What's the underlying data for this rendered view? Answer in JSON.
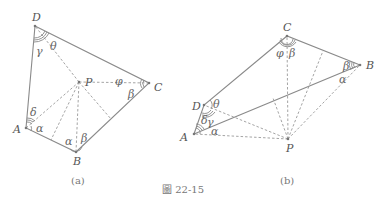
{
  "figure_caption": "圖 22-15",
  "subfigures": [
    {
      "id": "a",
      "caption": "(a)",
      "vertices": {
        "A": {
          "label": "A",
          "x": 26,
          "y": 128
        },
        "B": {
          "label": "B",
          "x": 76,
          "y": 152
        },
        "C": {
          "label": "C",
          "x": 149,
          "y": 83
        },
        "D": {
          "label": "D",
          "x": 35,
          "y": 26
        },
        "P": {
          "label": "P",
          "x": 79,
          "y": 82
        }
      },
      "angle_labels": {
        "D_gamma": "γ",
        "D_theta": "θ",
        "C_phi": "φ",
        "C_beta": "β",
        "A_delta": "δ",
        "A_alpha": "α",
        "B_alpha": "α",
        "B_beta": "β"
      }
    },
    {
      "id": "b",
      "caption": "(b)",
      "vertices": {
        "A": {
          "label": "A",
          "x": 194,
          "y": 134
        },
        "B": {
          "label": "B",
          "x": 360,
          "y": 65
        },
        "C": {
          "label": "C",
          "x": 287,
          "y": 36
        },
        "D": {
          "label": "D",
          "x": 204,
          "y": 105
        },
        "P": {
          "label": "P",
          "x": 288,
          "y": 139
        }
      },
      "angle_labels": {
        "C_phi": "φ",
        "C_beta": "β",
        "B_beta": "β",
        "B_alpha": "α",
        "D_theta": "θ",
        "D_gamma": "γ",
        "A_delta": "δ",
        "A_alpha": "α"
      }
    }
  ]
}
